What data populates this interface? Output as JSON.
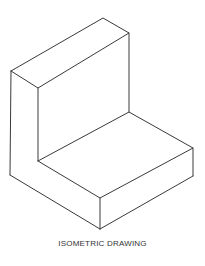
{
  "figure": {
    "caption": "ISOMETRIC DRAWING",
    "line_color": "#3a3a3a",
    "background": "#ffffff"
  }
}
